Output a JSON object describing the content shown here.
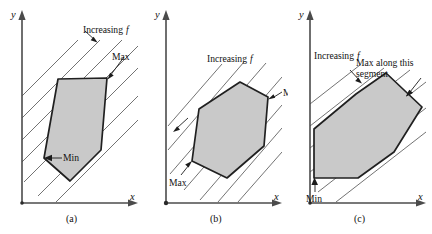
{
  "figure": {
    "type": "math-diagram",
    "axis_labels": {
      "x": "x",
      "y": "y"
    },
    "colors": {
      "region_fill": "#c9c9c9",
      "region_stroke": "#202020",
      "level_line": "#5a5a5a",
      "axis": "#4b4b4b",
      "text": "#111111",
      "background": "#ffffff"
    }
  },
  "panels": [
    {
      "id": "a",
      "caption": "(a)",
      "x_label": "x",
      "y_label": "y",
      "annotations": [
        {
          "name": "increasing-f",
          "text_1": "Increasing",
          "text_2": "f",
          "has_arrow": true
        },
        {
          "name": "max",
          "text": "Max",
          "has_arrow": true
        },
        {
          "name": "min",
          "text": "Min",
          "has_arrow": true
        }
      ]
    },
    {
      "id": "b",
      "caption": "(b)",
      "x_label": "x",
      "y_label": "y",
      "annotations": [
        {
          "name": "increasing-f",
          "text_1": "Increasing",
          "text_2": "f",
          "has_arrow": true
        },
        {
          "name": "min",
          "text": "Min",
          "has_arrow": true
        },
        {
          "name": "max",
          "text": "Max",
          "has_arrow": true
        }
      ]
    },
    {
      "id": "c",
      "caption": "(c)",
      "x_label": "x",
      "y_label": "y",
      "annotations": [
        {
          "name": "increasing-f",
          "text_1": "Increasing",
          "text_2": "f",
          "has_arrow": true
        },
        {
          "name": "max-along-segment",
          "text_line1": "Max along this",
          "text_line2": "segment",
          "has_arrow": true
        },
        {
          "name": "min",
          "text": "Min",
          "has_arrow": true
        }
      ]
    }
  ]
}
